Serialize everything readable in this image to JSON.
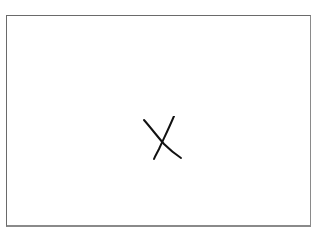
{
  "canvas": {
    "symbol": "x-mark",
    "caption": "",
    "colors": {
      "border": "#6a6a6a",
      "stroke": "#111111",
      "background": "#ffffff"
    }
  }
}
